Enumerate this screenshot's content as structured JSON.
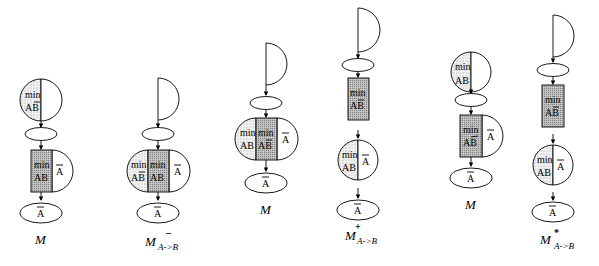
{
  "figure": {
    "panels": [
      {
        "label": "M",
        "superscript": "",
        "subscript": "",
        "top_node": {
          "shape": "circle-split",
          "left_text": [
            "min",
            "AB̅"
          ],
          "right_text": ""
        },
        "middle_node": {
          "shape": "rect-plus-halfcircle",
          "rect_text": [
            "min",
            "AB"
          ],
          "right_text": "A̅"
        },
        "bottom_node": {
          "text": "A̅"
        }
      },
      {
        "label": "M",
        "superscript": "–",
        "subscript": "A->B",
        "top_node": {
          "shape": "half-circle"
        },
        "middle_node": {
          "shape": "capsule-3",
          "left_text": [
            "min",
            "AB̅"
          ],
          "center_text": [
            "min",
            "AB"
          ],
          "right_text": "A̅"
        },
        "bottom_node": {
          "text": "A̅"
        }
      },
      {
        "label": "M",
        "superscript": "",
        "subscript": "",
        "top_node": {
          "shape": "half-circle"
        },
        "middle_node": {
          "shape": "capsule-3",
          "left_text": [
            "min",
            "AB"
          ],
          "center_text": [
            "min",
            "AB̅"
          ],
          "right_text": "A̅"
        },
        "bottom_node": {
          "text": "A̅"
        }
      },
      {
        "label": "M",
        "superscript": "+",
        "subscript": "A->B",
        "top_node": {
          "shape": "half-circle"
        },
        "rect_node": {
          "text": [
            "min",
            "AB̅"
          ]
        },
        "circle_node": {
          "left_text": [
            "min",
            "AB"
          ],
          "right_text": "A̅"
        },
        "bottom_node": {
          "text": "A̅"
        }
      },
      {
        "label": "M",
        "superscript": "",
        "subscript": "",
        "top_node": {
          "shape": "circle-split",
          "left_text": [
            "min",
            "AB"
          ],
          "right_text": ""
        },
        "middle_node": {
          "shape": "rect-plus-halfcircle",
          "rect_text": [
            "min",
            "AB̅"
          ],
          "right_text": "A̅"
        },
        "bottom_node": {
          "text": "A̅"
        }
      },
      {
        "label": "M",
        "superscript": "*",
        "subscript": "A->B",
        "top_node": {
          "shape": "half-circle"
        },
        "rect_node": {
          "text": [
            "min",
            "AB̅"
          ]
        },
        "circle_node": {
          "left_text": [
            "min",
            "AB"
          ],
          "right_text": "A̅"
        },
        "bottom_node": {
          "text": "A̅"
        }
      }
    ],
    "text": {
      "min": "min",
      "AB": "AB",
      "A": "A"
    }
  }
}
